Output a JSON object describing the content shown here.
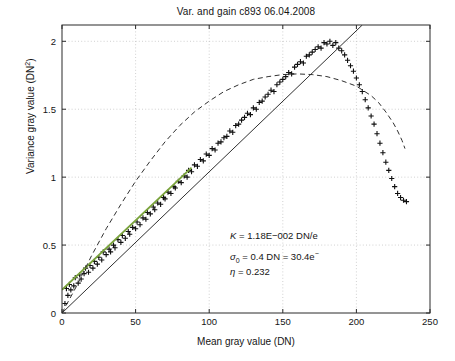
{
  "chart_data": {
    "type": "scatter",
    "title": "Var. and gain c893 06.04.2008",
    "xlabel": "Mean gray value (DN)",
    "ylabel": "Variance gray value (DN²)",
    "xlim": [
      0,
      250
    ],
    "ylim": [
      0,
      2.12
    ],
    "xticks": [
      0,
      50,
      100,
      150,
      200,
      250
    ],
    "yticks": [
      0,
      0.5,
      1,
      1.5,
      2
    ],
    "xtick_labels": [
      "0",
      "50",
      "100",
      "150",
      "200",
      "250"
    ],
    "ytick_labels": [
      "0",
      "0.5",
      "1",
      "1.5",
      "2"
    ],
    "grid": true,
    "legend": "none",
    "series": [
      {
        "name": "measured variance",
        "type": "scatter",
        "marker": "plus",
        "color": "#101010",
        "points": [
          [
            2,
            0.07
          ],
          [
            3,
            0.18
          ],
          [
            4,
            0.13
          ],
          [
            5,
            0.21
          ],
          [
            6,
            0.17
          ],
          [
            8,
            0.2
          ],
          [
            9,
            0.26
          ],
          [
            11,
            0.22
          ],
          [
            12,
            0.28
          ],
          [
            13,
            0.25
          ],
          [
            15,
            0.29
          ],
          [
            16,
            0.33
          ],
          [
            18,
            0.3
          ],
          [
            19,
            0.35
          ],
          [
            21,
            0.33
          ],
          [
            22,
            0.38
          ],
          [
            24,
            0.36
          ],
          [
            25,
            0.41
          ],
          [
            27,
            0.39
          ],
          [
            28,
            0.45
          ],
          [
            30,
            0.43
          ],
          [
            32,
            0.47
          ],
          [
            33,
            0.45
          ],
          [
            35,
            0.5
          ],
          [
            36,
            0.48
          ],
          [
            38,
            0.54
          ],
          [
            40,
            0.52
          ],
          [
            41,
            0.57
          ],
          [
            43,
            0.55
          ],
          [
            45,
            0.6
          ],
          [
            46,
            0.58
          ],
          [
            48,
            0.63
          ],
          [
            50,
            0.62
          ],
          [
            51,
            0.67
          ],
          [
            53,
            0.65
          ],
          [
            55,
            0.7
          ],
          [
            57,
            0.69
          ],
          [
            58,
            0.74
          ],
          [
            60,
            0.73
          ],
          [
            62,
            0.78
          ],
          [
            63,
            0.76
          ],
          [
            65,
            0.81
          ],
          [
            67,
            0.8
          ],
          [
            69,
            0.85
          ],
          [
            70,
            0.84
          ],
          [
            72,
            0.89
          ],
          [
            74,
            0.88
          ],
          [
            76,
            0.93
          ],
          [
            77,
            0.92
          ],
          [
            79,
            0.97
          ],
          [
            81,
            0.96
          ],
          [
            83,
            1.01
          ],
          [
            85,
            1.0
          ],
          [
            86,
            1.05
          ],
          [
            88,
            1.04
          ],
          [
            90,
            1.09
          ],
          [
            92,
            1.08
          ],
          [
            94,
            1.13
          ],
          [
            96,
            1.12
          ],
          [
            98,
            1.17
          ],
          [
            100,
            1.16
          ],
          [
            102,
            1.21
          ],
          [
            104,
            1.2
          ],
          [
            106,
            1.25
          ],
          [
            108,
            1.26
          ],
          [
            110,
            1.29
          ],
          [
            112,
            1.3
          ],
          [
            114,
            1.34
          ],
          [
            116,
            1.33
          ],
          [
            118,
            1.38
          ],
          [
            120,
            1.39
          ],
          [
            122,
            1.42
          ],
          [
            124,
            1.44
          ],
          [
            126,
            1.47
          ],
          [
            128,
            1.46
          ],
          [
            130,
            1.51
          ],
          [
            132,
            1.5
          ],
          [
            134,
            1.55
          ],
          [
            136,
            1.56
          ],
          [
            138,
            1.59
          ],
          [
            140,
            1.61
          ],
          [
            142,
            1.64
          ],
          [
            144,
            1.63
          ],
          [
            146,
            1.68
          ],
          [
            148,
            1.7
          ],
          [
            150,
            1.72
          ],
          [
            152,
            1.74
          ],
          [
            154,
            1.77
          ],
          [
            156,
            1.76
          ],
          [
            158,
            1.81
          ],
          [
            160,
            1.83
          ],
          [
            162,
            1.85
          ],
          [
            164,
            1.84
          ],
          [
            166,
            1.89
          ],
          [
            168,
            1.9
          ],
          [
            170,
            1.92
          ],
          [
            172,
            1.94
          ],
          [
            174,
            1.96
          ],
          [
            176,
            1.95
          ],
          [
            178,
            1.99
          ],
          [
            180,
            1.98
          ],
          [
            182,
            2.0
          ],
          [
            184,
            1.97
          ],
          [
            186,
            1.99
          ],
          [
            188,
            1.95
          ],
          [
            190,
            1.93
          ],
          [
            192,
            1.9
          ],
          [
            194,
            1.86
          ],
          [
            196,
            1.82
          ],
          [
            198,
            1.78
          ],
          [
            200,
            1.73
          ],
          [
            202,
            1.68
          ],
          [
            204,
            1.63
          ],
          [
            206,
            1.57
          ],
          [
            208,
            1.51
          ],
          [
            210,
            1.45
          ],
          [
            212,
            1.39
          ],
          [
            214,
            1.32
          ],
          [
            216,
            1.25
          ],
          [
            218,
            1.18
          ],
          [
            220,
            1.11
          ],
          [
            222,
            1.05
          ],
          [
            224,
            0.99
          ],
          [
            226,
            0.93
          ],
          [
            228,
            0.88
          ],
          [
            230,
            0.85
          ],
          [
            232,
            0.83
          ],
          [
            234,
            0.82
          ]
        ]
      },
      {
        "name": "linear gain fit",
        "type": "line",
        "style": "solid",
        "color": "#7aa33c",
        "points": [
          [
            0,
            0.17
          ],
          [
            88,
            1.07
          ]
        ]
      },
      {
        "name": "extrapolated linear fit",
        "type": "line",
        "style": "solid",
        "color": "#303030",
        "points": [
          [
            0,
            0.0
          ],
          [
            204,
            2.12
          ]
        ]
      },
      {
        "name": "photon transfer model",
        "type": "line",
        "style": "dashed",
        "color": "#303030",
        "points": [
          [
            0,
            0.0
          ],
          [
            10,
            0.2
          ],
          [
            20,
            0.42
          ],
          [
            30,
            0.62
          ],
          [
            40,
            0.8
          ],
          [
            50,
            0.97
          ],
          [
            60,
            1.12
          ],
          [
            70,
            1.26
          ],
          [
            80,
            1.38
          ],
          [
            90,
            1.48
          ],
          [
            100,
            1.56
          ],
          [
            110,
            1.63
          ],
          [
            120,
            1.68
          ],
          [
            130,
            1.72
          ],
          [
            140,
            1.74
          ],
          [
            150,
            1.755
          ],
          [
            160,
            1.76
          ],
          [
            170,
            1.755
          ],
          [
            180,
            1.74
          ],
          [
            190,
            1.71
          ],
          [
            200,
            1.67
          ],
          [
            210,
            1.6
          ],
          [
            215,
            1.55
          ],
          [
            220,
            1.48
          ],
          [
            225,
            1.4
          ],
          [
            228,
            1.34
          ],
          [
            231,
            1.27
          ],
          [
            233,
            1.21
          ]
        ]
      }
    ],
    "annotations": {
      "gain_label": "K",
      "gain_value": "= 1.18E−002 DN/e",
      "sigma_symbol": "σ",
      "sigma_subscript": "0",
      "sigma_value": "= 0.4 DN = 30.4e",
      "sigma_superscript": "−",
      "eta_symbol": "η",
      "eta_value": "= 0.232"
    }
  }
}
